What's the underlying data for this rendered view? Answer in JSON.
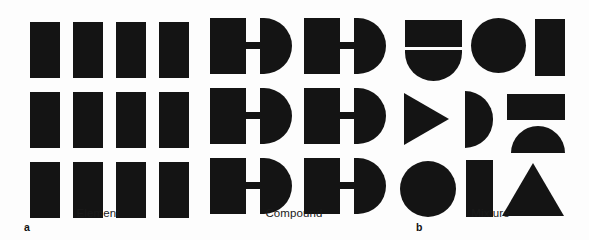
{
  "figure": {
    "background_color": "#fdfdfd",
    "ink_color": "#141414",
    "panels": [
      {
        "letter": "a",
        "caption": "Element",
        "description": "Twelve identical single-atom particles arranged in a 3 by 4 grid",
        "particle_count": 12,
        "rows": 3,
        "columns": 4
      },
      {
        "letter": "b",
        "caption": "Compound",
        "description": "Six identical two-atom molecules arranged in a 3 by 2 grid",
        "particle_count": 6,
        "rows": 3,
        "columns": 2
      },
      {
        "letter": "c",
        "caption": "Mixture",
        "description": "Assorted unlike particles of differing shapes and sizes",
        "particle_count": 11,
        "rows": 3,
        "columns": 3
      }
    ]
  },
  "element_particles": [
    {
      "shape": "rect",
      "x": 30,
      "y": 14,
      "w": 30,
      "h": 56
    },
    {
      "shape": "rect",
      "x": 73,
      "y": 14,
      "w": 30,
      "h": 56
    },
    {
      "shape": "rect",
      "x": 116,
      "y": 14,
      "w": 30,
      "h": 56
    },
    {
      "shape": "rect",
      "x": 159,
      "y": 14,
      "w": 30,
      "h": 56
    },
    {
      "shape": "rect",
      "x": 30,
      "y": 84,
      "w": 30,
      "h": 56
    },
    {
      "shape": "rect",
      "x": 73,
      "y": 84,
      "w": 30,
      "h": 56
    },
    {
      "shape": "rect",
      "x": 116,
      "y": 84,
      "w": 30,
      "h": 56
    },
    {
      "shape": "rect",
      "x": 159,
      "y": 84,
      "w": 30,
      "h": 56
    },
    {
      "shape": "rect",
      "x": 30,
      "y": 154,
      "w": 30,
      "h": 56
    },
    {
      "shape": "rect",
      "x": 73,
      "y": 154,
      "w": 30,
      "h": 56
    },
    {
      "shape": "rect",
      "x": 116,
      "y": 154,
      "w": 30,
      "h": 56
    },
    {
      "shape": "rect",
      "x": 159,
      "y": 154,
      "w": 30,
      "h": 56
    }
  ],
  "compound_particles": [
    {
      "shape": "rect-bond-dome",
      "x": 14,
      "y": 10
    },
    {
      "shape": "rect-bond-dome",
      "x": 108,
      "y": 10
    },
    {
      "shape": "rect-bond-dome",
      "x": 14,
      "y": 80
    },
    {
      "shape": "rect-bond-dome",
      "x": 108,
      "y": 80
    },
    {
      "shape": "rect-bond-dome",
      "x": 14,
      "y": 150
    },
    {
      "shape": "rect-bond-dome",
      "x": 108,
      "y": 150
    }
  ],
  "mixture_particles": [
    {
      "shape": "rect",
      "label": "horizontal-rectangle",
      "x": 13,
      "y": 12,
      "w": 57,
      "h": 27
    },
    {
      "shape": "half-down",
      "label": "dome-pointing-down",
      "x": 13,
      "y": 42,
      "w": 57,
      "h": 31
    },
    {
      "shape": "circle",
      "label": "circle",
      "x": 79,
      "y": 10,
      "w": 55,
      "h": 55
    },
    {
      "shape": "rect",
      "label": "vertical-rectangle",
      "x": 143,
      "y": 11,
      "w": 30,
      "h": 57
    },
    {
      "shape": "tri-right",
      "label": "triangle-pointing-right",
      "x": 12,
      "y": 85,
      "w": 45,
      "h": 52
    },
    {
      "shape": "half-right",
      "label": "dome-pointing-right",
      "x": 73,
      "y": 83,
      "w": 28,
      "h": 57
    },
    {
      "shape": "rect",
      "label": "horizontal-rectangle",
      "x": 115,
      "y": 86,
      "w": 58,
      "h": 26
    },
    {
      "shape": "half-up",
      "label": "dome-pointing-up",
      "x": 119,
      "y": 118,
      "w": 54,
      "h": 27
    },
    {
      "shape": "circle",
      "label": "circle",
      "x": 8,
      "y": 153,
      "w": 56,
      "h": 56
    },
    {
      "shape": "rect",
      "label": "vertical-rectangle",
      "x": 74,
      "y": 152,
      "w": 27,
      "h": 57
    },
    {
      "shape": "tri-up",
      "label": "triangle-pointing-up",
      "x": 110,
      "y": 155,
      "w": 62,
      "h": 53
    }
  ]
}
